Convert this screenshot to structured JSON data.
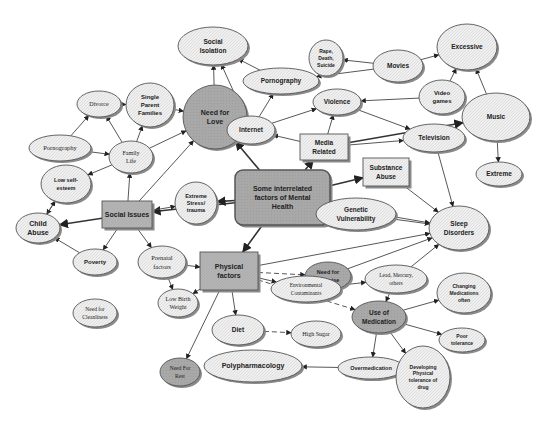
{
  "colors": {
    "background": "#ffffff",
    "dark_fill": "#a9a9a9",
    "light_fill": "#ececec",
    "box_fill": "#b3b3b3",
    "stroke": "#555555",
    "shadow": "#8a8a8a"
  },
  "nodes": [
    {
      "id": "center",
      "shape": "roundrect",
      "x": 235,
      "y": 170,
      "w": 95,
      "h": 55,
      "fill": "dark",
      "lines": [
        "Some interrelated",
        "factors of Mental",
        "Health"
      ],
      "size": 7
    },
    {
      "id": "social_issues",
      "shape": "rect",
      "x": 102,
      "y": 201,
      "w": 50,
      "h": 27,
      "fill": "box",
      "lines": [
        "Social Issues"
      ],
      "size": 7
    },
    {
      "id": "physical_factors",
      "shape": "rect",
      "x": 200,
      "y": 252,
      "w": 58,
      "h": 38,
      "fill": "box",
      "lines": [
        "Physical",
        "factors"
      ],
      "size": 7
    },
    {
      "id": "media_related",
      "shape": "rect",
      "x": 300,
      "y": 134,
      "w": 48,
      "h": 26,
      "fill": "light",
      "lines": [
        "Media",
        "Related"
      ],
      "size": 6.5
    },
    {
      "id": "substance_abuse",
      "shape": "rect",
      "x": 363,
      "y": 158,
      "w": 46,
      "h": 28,
      "fill": "light",
      "lines": [
        "Substance",
        "Abuse"
      ],
      "size": 6.5
    },
    {
      "id": "social_isolation",
      "shape": "ellipse",
      "cx": 213,
      "cy": 46,
      "rx": 35,
      "ry": 19,
      "fill": "light",
      "lines": [
        "Social",
        "Isolation"
      ],
      "size": 6.5
    },
    {
      "id": "need_for_love",
      "shape": "circle",
      "cx": 215,
      "cy": 117,
      "rx": 32,
      "ry": 32,
      "fill": "dark",
      "lines": [
        "Need for",
        "Love"
      ],
      "size": 7
    },
    {
      "id": "divorce",
      "shape": "ellipse",
      "cx": 99,
      "cy": 104,
      "rx": 22,
      "ry": 13,
      "fill": "light",
      "lines": [
        "Divorce"
      ],
      "size": 6,
      "serif": true
    },
    {
      "id": "single_parent",
      "shape": "ellipse",
      "cx": 150,
      "cy": 105,
      "rx": 24,
      "ry": 22,
      "fill": "light",
      "lines": [
        "Single",
        "Parent",
        "Families"
      ],
      "size": 6
    },
    {
      "id": "pornography_left",
      "shape": "ellipse",
      "cx": 60,
      "cy": 148,
      "rx": 31,
      "ry": 13,
      "fill": "light",
      "lines": [
        "Pornography"
      ],
      "size": 6.5,
      "serif": true
    },
    {
      "id": "family_life",
      "shape": "ellipse",
      "cx": 131,
      "cy": 157,
      "rx": 22,
      "ry": 16,
      "fill": "light",
      "lines": [
        "Family",
        "Life"
      ],
      "size": 6,
      "serif": true
    },
    {
      "id": "low_self_esteem",
      "shape": "ellipse",
      "cx": 66,
      "cy": 184,
      "rx": 25,
      "ry": 19,
      "fill": "light",
      "lines": [
        "Low self-",
        "esteem"
      ],
      "size": 5.5
    },
    {
      "id": "child_abuse",
      "shape": "ellipse",
      "cx": 38,
      "cy": 228,
      "rx": 22,
      "ry": 15,
      "fill": "light",
      "lines": [
        "Child",
        "Abuse"
      ],
      "size": 7
    },
    {
      "id": "extreme_stress",
      "shape": "circle",
      "cx": 196,
      "cy": 203,
      "rx": 21,
      "ry": 21,
      "fill": "light",
      "lines": [
        "Extreme",
        "Stress/",
        "trauma"
      ],
      "size": 5.5
    },
    {
      "id": "poverty",
      "shape": "ellipse",
      "cx": 95,
      "cy": 262,
      "rx": 22,
      "ry": 13,
      "fill": "light",
      "lines": [
        "Poverty"
      ],
      "size": 6
    },
    {
      "id": "prenatal",
      "shape": "ellipse",
      "cx": 162,
      "cy": 262,
      "rx": 24,
      "ry": 16,
      "fill": "light",
      "lines": [
        "Prenatal",
        "factors"
      ],
      "size": 6.5,
      "serif": true
    },
    {
      "id": "need_for_cleanliness",
      "shape": "ellipse",
      "cx": 95,
      "cy": 313,
      "rx": 22,
      "ry": 14,
      "fill": "light",
      "lines": [
        "Need for",
        "Cleanliness"
      ],
      "size": 5.5,
      "serif": true
    },
    {
      "id": "low_birth_weight",
      "shape": "ellipse",
      "cx": 178,
      "cy": 303,
      "rx": 20,
      "ry": 14,
      "fill": "light",
      "lines": [
        "Low Birth",
        "Weight"
      ],
      "size": 6,
      "serif": true
    },
    {
      "id": "need_for_rest",
      "shape": "ellipse",
      "cx": 180,
      "cy": 372,
      "rx": 20,
      "ry": 14,
      "fill": "dark",
      "lines": [
        "Need For",
        "Rest"
      ],
      "size": 5.5,
      "serif": true
    },
    {
      "id": "diet",
      "shape": "ellipse",
      "cx": 238,
      "cy": 330,
      "rx": 26,
      "ry": 15,
      "fill": "light",
      "lines": [
        "Diet"
      ],
      "size": 6.5
    },
    {
      "id": "high_sugar",
      "shape": "ellipse",
      "cx": 316,
      "cy": 334,
      "rx": 25,
      "ry": 13,
      "fill": "light",
      "lines": [
        "High Sugar"
      ],
      "size": 6,
      "serif": true
    },
    {
      "id": "polypharmacology",
      "shape": "ellipse",
      "cx": 253,
      "cy": 366,
      "rx": 49,
      "ry": 16,
      "fill": "light",
      "lines": [
        "Polypharmacology"
      ],
      "size": 7
    },
    {
      "id": "overmedication",
      "shape": "ellipse",
      "cx": 371,
      "cy": 368,
      "rx": 33,
      "ry": 11,
      "fill": "light",
      "lines": [
        "Overmedication"
      ],
      "size": 5.5
    },
    {
      "id": "internet",
      "shape": "ellipse",
      "cx": 251,
      "cy": 130,
      "rx": 24,
      "ry": 14,
      "fill": "light",
      "lines": [
        "Internet"
      ],
      "size": 6.5
    },
    {
      "id": "pornography_top",
      "shape": "ellipse",
      "cx": 281,
      "cy": 81,
      "rx": 38,
      "ry": 13,
      "fill": "light",
      "lines": [
        "Pornography"
      ],
      "size": 6.5
    },
    {
      "id": "rape_death_suicide",
      "shape": "ellipse",
      "cx": 326,
      "cy": 58,
      "rx": 17,
      "ry": 18,
      "fill": "light",
      "lines": [
        "Rape,",
        "Death,",
        "Suicide"
      ],
      "size": 5
    },
    {
      "id": "violence",
      "shape": "ellipse",
      "cx": 337,
      "cy": 102,
      "rx": 24,
      "ry": 13,
      "fill": "light",
      "lines": [
        "Violence"
      ],
      "size": 6.5
    },
    {
      "id": "movies",
      "shape": "ellipse",
      "cx": 398,
      "cy": 66,
      "rx": 25,
      "ry": 16,
      "fill": "light",
      "lines": [
        "Movies"
      ],
      "size": 6.5
    },
    {
      "id": "excessive",
      "shape": "ellipse",
      "cx": 467,
      "cy": 47,
      "rx": 30,
      "ry": 23,
      "fill": "light",
      "lines": [
        "Excessive"
      ],
      "size": 6.5
    },
    {
      "id": "video_games",
      "shape": "ellipse",
      "cx": 442,
      "cy": 97,
      "rx": 23,
      "ry": 17,
      "fill": "light",
      "lines": [
        "Video",
        "games"
      ],
      "size": 6
    },
    {
      "id": "music",
      "shape": "ellipse",
      "cx": 496,
      "cy": 117,
      "rx": 34,
      "ry": 24,
      "fill": "light",
      "lines": [
        "Music"
      ],
      "size": 6.5
    },
    {
      "id": "television",
      "shape": "ellipse",
      "cx": 434,
      "cy": 138,
      "rx": 31,
      "ry": 14,
      "fill": "light",
      "lines": [
        "Television"
      ],
      "size": 6.5
    },
    {
      "id": "extreme",
      "shape": "ellipse",
      "cx": 499,
      "cy": 174,
      "rx": 23,
      "ry": 12,
      "fill": "light",
      "lines": [
        "Extreme"
      ],
      "size": 6.5
    },
    {
      "id": "genetic_vulnerability",
      "shape": "ellipse",
      "cx": 356,
      "cy": 214,
      "rx": 40,
      "ry": 16,
      "fill": "light",
      "lines": [
        "Genetic",
        "Vulnerability"
      ],
      "size": 6.5
    },
    {
      "id": "sleep_disorders",
      "shape": "ellipse",
      "cx": 459,
      "cy": 228,
      "rx": 30,
      "ry": 22,
      "fill": "light",
      "lines": [
        "Sleep",
        "Disorders"
      ],
      "size": 6.5
    },
    {
      "id": "need_for_exercise",
      "shape": "ellipse",
      "cx": 328,
      "cy": 276,
      "rx": 23,
      "ry": 14,
      "fill": "dark",
      "lines": [
        "Need for",
        "Exercise"
      ],
      "size": 5.5
    },
    {
      "id": "environmental_contaminants",
      "shape": "ellipse",
      "cx": 306,
      "cy": 289,
      "rx": 35,
      "ry": 13,
      "fill": "light",
      "lines": [
        "Environmental",
        "Contaminants"
      ],
      "size": 5.5,
      "serif": true
    },
    {
      "id": "lead_mercury",
      "shape": "ellipse",
      "cx": 396,
      "cy": 279,
      "rx": 31,
      "ry": 14,
      "fill": "light",
      "lines": [
        "Lead, Mercury,",
        "others"
      ],
      "size": 5.5,
      "serif": true
    },
    {
      "id": "use_of_medication",
      "shape": "ellipse",
      "cx": 379,
      "cy": 317,
      "rx": 27,
      "ry": 16,
      "fill": "dark",
      "lines": [
        "Use of",
        "Medication"
      ],
      "size": 6.5
    },
    {
      "id": "changing_medications",
      "shape": "ellipse",
      "cx": 464,
      "cy": 293,
      "rx": 27,
      "ry": 20,
      "fill": "light",
      "lines": [
        "Changing",
        "Medications",
        "often"
      ],
      "size": 5
    },
    {
      "id": "poor_tolerance",
      "shape": "ellipse",
      "cx": 462,
      "cy": 340,
      "rx": 23,
      "ry": 12,
      "fill": "light",
      "lines": [
        "Poor",
        "tolerance"
      ],
      "size": 5
    },
    {
      "id": "developing_tolerance",
      "shape": "ellipse",
      "cx": 423,
      "cy": 377,
      "rx": 27,
      "ry": 31,
      "fill": "light",
      "lines": [
        "Developing",
        "Physical",
        "tolerance of",
        "drug"
      ],
      "size": 5
    }
  ],
  "edges": [
    [
      "center",
      "social_issues",
      "thick"
    ],
    [
      "center",
      "physical_factors",
      "thick"
    ],
    [
      "center",
      "extreme_stress",
      "thick"
    ],
    [
      "center",
      "need_for_love",
      "thick"
    ],
    [
      "center",
      "media_related",
      "thick"
    ],
    [
      "center",
      "substance_abuse",
      "thick"
    ],
    [
      "center",
      "genetic_vulnerability",
      "dashed"
    ],
    [
      "center",
      "sleep_disorders",
      "plain"
    ],
    [
      "social_issues",
      "child_abuse",
      "thick"
    ],
    [
      "social_issues",
      "family_life",
      "plain"
    ],
    [
      "social_issues",
      "extreme_stress",
      "plain"
    ],
    [
      "social_issues",
      "poverty",
      "plain"
    ],
    [
      "social_issues",
      "prenatal",
      "plain"
    ],
    [
      "social_issues",
      "need_for_love",
      "plain"
    ],
    [
      "family_life",
      "divorce",
      "plain"
    ],
    [
      "family_life",
      "single_parent",
      "plain"
    ],
    [
      "family_life",
      "need_for_love",
      "plain"
    ],
    [
      "family_life",
      "low_self_esteem",
      "plain"
    ],
    [
      "divorce",
      "single_parent",
      "plain"
    ],
    [
      "single_parent",
      "need_for_love",
      "plain"
    ],
    [
      "pornography_left",
      "divorce",
      "plain"
    ],
    [
      "pornography_left",
      "family_life",
      "plain"
    ],
    [
      "low_self_esteem",
      "child_abuse",
      "plain"
    ],
    [
      "child_abuse",
      "low_self_esteem",
      "plain"
    ],
    [
      "poverty",
      "child_abuse",
      "plain"
    ],
    [
      "need_for_love",
      "social_isolation",
      "plain"
    ],
    [
      "internet",
      "social_isolation",
      "plain"
    ],
    [
      "internet",
      "pornography_top",
      "plain"
    ],
    [
      "internet",
      "violence",
      "plain"
    ],
    [
      "media_related",
      "internet",
      "plain"
    ],
    [
      "media_related",
      "violence",
      "plain"
    ],
    [
      "media_related",
      "television",
      "plain"
    ],
    [
      "media_related",
      "music",
      "thick"
    ],
    [
      "pornography_top",
      "social_isolation",
      "plain"
    ],
    [
      "movies",
      "pornography_top",
      "plain"
    ],
    [
      "movies",
      "rape_death_suicide",
      "plain"
    ],
    [
      "movies",
      "excessive",
      "plain"
    ],
    [
      "video_games",
      "violence",
      "plain"
    ],
    [
      "video_games",
      "excessive",
      "plain"
    ],
    [
      "music",
      "excessive",
      "plain"
    ],
    [
      "music",
      "extreme",
      "plain"
    ],
    [
      "violence",
      "television",
      "plain"
    ],
    [
      "television",
      "sleep_disorders",
      "plain"
    ],
    [
      "substance_abuse",
      "sleep_disorders",
      "plain"
    ],
    [
      "genetic_vulnerability",
      "sleep_disorders",
      "plain"
    ],
    [
      "physical_factors",
      "sleep_disorders",
      "plain"
    ],
    [
      "prenatal",
      "physical_factors",
      "plain"
    ],
    [
      "prenatal",
      "low_birth_weight",
      "plain"
    ],
    [
      "physical_factors",
      "low_birth_weight",
      "plain"
    ],
    [
      "physical_factors",
      "diet",
      "plain"
    ],
    [
      "physical_factors",
      "need_for_rest",
      "plain"
    ],
    [
      "physical_factors",
      "need_for_exercise",
      "dashed"
    ],
    [
      "physical_factors",
      "environmental_contaminants",
      "plain"
    ],
    [
      "physical_factors",
      "use_of_medication",
      "dashed"
    ],
    [
      "environmental_contaminants",
      "lead_mercury",
      "plain"
    ],
    [
      "lead_mercury",
      "sleep_disorders",
      "plain"
    ],
    [
      "need_for_exercise",
      "sleep_disorders",
      "plain"
    ],
    [
      "diet",
      "high_sugar",
      "dashed"
    ],
    [
      "use_of_medication",
      "changing_medications",
      "plain"
    ],
    [
      "use_of_medication",
      "poor_tolerance",
      "plain"
    ],
    [
      "use_of_medication",
      "developing_tolerance",
      "plain"
    ],
    [
      "use_of_medication",
      "overmedication",
      "plain"
    ],
    [
      "overmedication",
      "polypharmacology",
      "plain"
    ],
    [
      "lead_mercury",
      "use_of_medication",
      "plain"
    ]
  ]
}
